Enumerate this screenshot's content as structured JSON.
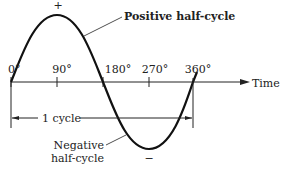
{
  "diagram": {
    "type": "sine-wave",
    "axis_label": "Time",
    "angle_ticks": [
      "0°",
      "90°",
      "180°",
      "270°",
      "360°"
    ],
    "annotations": {
      "positive_half": "Positive half-cycle",
      "negative_half_line1": "Negative",
      "negative_half_line2": "half-cycle",
      "cycle": "1 cycle",
      "plus_sign": "+",
      "minus_sign": "−"
    }
  }
}
